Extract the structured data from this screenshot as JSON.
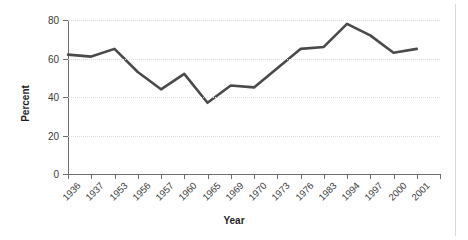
{
  "chart_data": {
    "type": "line",
    "title": "",
    "xlabel": "Year",
    "ylabel": "Percent",
    "ylim": [
      0,
      80
    ],
    "yticks": [
      0,
      20,
      40,
      60,
      80
    ],
    "ytick_labels": [
      "0",
      "20",
      "40",
      "60",
      "80"
    ],
    "grid": true,
    "legend": false,
    "legend_position": "none",
    "categories": [
      "1936",
      "1937",
      "1953",
      "1956",
      "1957",
      "1960",
      "1965",
      "1969",
      "1970",
      "1973",
      "1976",
      "1983",
      "1994",
      "1997",
      "2000",
      "2001"
    ],
    "values": [
      62,
      61,
      65,
      53,
      44,
      52,
      37,
      46,
      45,
      55,
      65,
      66,
      78,
      72,
      63,
      65
    ],
    "series": [
      {
        "name": "Percent",
        "color": "#4a4a4a",
        "values": [
          62,
          61,
          65,
          53,
          44,
          52,
          37,
          46,
          45,
          55,
          65,
          66,
          78,
          72,
          63,
          65
        ]
      }
    ],
    "n_xticks": 17,
    "line_color": "#4a4a4a",
    "line_width": 2.6,
    "gridline_color": "#dcdcdc",
    "axis_color": "#6e6e6e",
    "background_color": "#ffffff"
  }
}
